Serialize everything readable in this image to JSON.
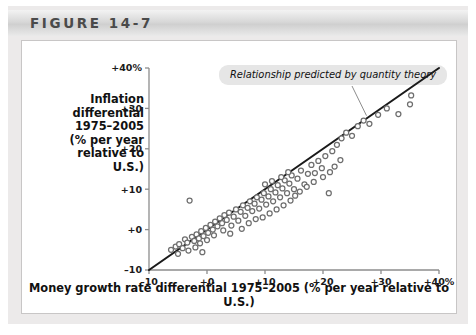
{
  "figure": {
    "header_label": "FIGURE 14-7"
  },
  "annotation": {
    "text": "Relationship predicted by quantity theory"
  },
  "chart_data": {
    "type": "scatter",
    "title": "",
    "ylabel": "Inflation differential 1975–2005 (% per year relative to U.S.)",
    "ylabel_lines": [
      "Inflation",
      "differential",
      "1975–2005",
      "(% per year",
      "relative to",
      "U.S.)"
    ],
    "xlabel": "Money growth rate differential 1975–2005 (% per year relative to U.S.)",
    "xlim": [
      -10,
      40
    ],
    "ylim": [
      -10,
      40
    ],
    "xticks": [
      -10,
      0,
      10,
      20,
      30,
      40
    ],
    "xtick_labels": [
      "–10",
      "+0",
      "+10",
      "+20",
      "+30",
      "+40%"
    ],
    "yticks": [
      -10,
      0,
      10,
      20,
      30,
      40
    ],
    "ytick_labels": [
      "–10",
      "+0",
      "+10",
      "+20",
      "+30",
      "+40%"
    ],
    "grid": false,
    "legend": null,
    "reference_line": {
      "name": "45-degree line",
      "label": "Relationship predicted by quantity theory",
      "slope": 1,
      "intercept": 0,
      "from": [
        -10,
        -10
      ],
      "to": [
        40,
        40
      ]
    },
    "marker_style": "open-circle",
    "points": [
      [
        -6.2,
        -5.0
      ],
      [
        -5.4,
        -4.2
      ],
      [
        -4.8,
        -3.6
      ],
      [
        -4.2,
        -4.6
      ],
      [
        -3.8,
        -2.4
      ],
      [
        -3.4,
        -3.2
      ],
      [
        -3.0,
        7.2
      ],
      [
        -2.6,
        -1.8
      ],
      [
        -2.2,
        -2.8
      ],
      [
        -1.8,
        -1.2
      ],
      [
        -1.4,
        -2.2
      ],
      [
        -1.0,
        -0.4
      ],
      [
        -0.6,
        -1.6
      ],
      [
        -0.2,
        0.4
      ],
      [
        0.2,
        -0.8
      ],
      [
        0.6,
        1.2
      ],
      [
        1.0,
        0.0
      ],
      [
        1.4,
        2.0
      ],
      [
        1.8,
        0.8
      ],
      [
        2.2,
        2.8
      ],
      [
        2.6,
        1.6
      ],
      [
        3.0,
        3.6
      ],
      [
        3.4,
        2.4
      ],
      [
        3.8,
        4.2
      ],
      [
        4.2,
        1.0
      ],
      [
        4.6,
        3.2
      ],
      [
        5.0,
        5.0
      ],
      [
        5.4,
        2.2
      ],
      [
        5.8,
        4.4
      ],
      [
        6.2,
        6.0
      ],
      [
        6.6,
        3.4
      ],
      [
        7.0,
        5.4
      ],
      [
        7.4,
        7.0
      ],
      [
        7.8,
        4.6
      ],
      [
        8.2,
        6.4
      ],
      [
        8.6,
        8.0
      ],
      [
        9.0,
        5.2
      ],
      [
        9.4,
        7.4
      ],
      [
        9.8,
        9.0
      ],
      [
        10.2,
        6.2
      ],
      [
        10.6,
        8.2
      ],
      [
        11.0,
        10.0
      ],
      [
        11.4,
        7.0
      ],
      [
        11.8,
        9.2
      ],
      [
        12.2,
        11.0
      ],
      [
        12.6,
        8.0
      ],
      [
        13.0,
        10.2
      ],
      [
        13.4,
        12.2
      ],
      [
        13.8,
        9.0
      ],
      [
        14.2,
        11.4
      ],
      [
        14.6,
        13.4
      ],
      [
        15.0,
        10.0
      ],
      [
        15.6,
        12.6
      ],
      [
        16.2,
        14.6
      ],
      [
        16.8,
        11.2
      ],
      [
        17.4,
        13.8
      ],
      [
        18.0,
        16.0
      ],
      [
        18.6,
        14.0
      ],
      [
        19.2,
        17.0
      ],
      [
        19.8,
        15.2
      ],
      [
        20.4,
        18.2
      ],
      [
        21.0,
        9.0
      ],
      [
        21.6,
        19.4
      ],
      [
        22.4,
        21.0
      ],
      [
        23.2,
        22.6
      ],
      [
        24.0,
        24.0
      ],
      [
        25.0,
        23.2
      ],
      [
        26.0,
        25.6
      ],
      [
        27.0,
        27.0
      ],
      [
        28.0,
        26.2
      ],
      [
        29.5,
        28.4
      ],
      [
        31.0,
        30.0
      ],
      [
        33.0,
        28.6
      ],
      [
        35.0,
        31.0
      ],
      [
        35.2,
        33.2
      ],
      [
        6.0,
        0.2
      ],
      [
        7.2,
        1.6
      ],
      [
        8.4,
        2.6
      ],
      [
        9.6,
        3.0
      ],
      [
        10.8,
        4.0
      ],
      [
        12.0,
        5.0
      ],
      [
        13.2,
        6.0
      ],
      [
        14.4,
        7.2
      ],
      [
        4.0,
        -1.0
      ],
      [
        2.8,
        -0.2
      ],
      [
        1.2,
        -1.4
      ],
      [
        0.0,
        -2.6
      ],
      [
        -1.2,
        -3.4
      ],
      [
        16.0,
        9.4
      ],
      [
        17.2,
        10.6
      ],
      [
        18.4,
        11.8
      ],
      [
        15.2,
        8.4
      ],
      [
        20.0,
        13.0
      ],
      [
        21.2,
        14.2
      ],
      [
        22.0,
        15.6
      ],
      [
        23.0,
        17.2
      ],
      [
        -5.0,
        -6.0
      ],
      [
        -3.2,
        -5.2
      ],
      [
        -2.0,
        -4.4
      ],
      [
        -0.8,
        -5.6
      ],
      [
        11.2,
        12.0
      ],
      [
        12.8,
        13.0
      ],
      [
        14.0,
        14.2
      ],
      [
        10.0,
        11.2
      ]
    ]
  }
}
